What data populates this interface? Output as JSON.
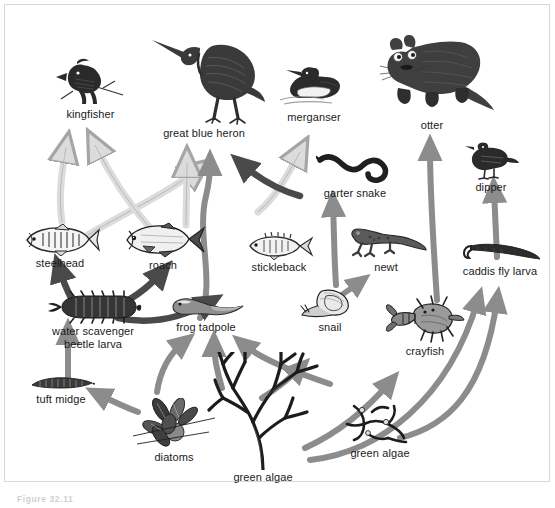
{
  "figure": {
    "caption": "Figure 32.11",
    "width": 555,
    "height": 508,
    "background": "#ffffff",
    "border_color": "#d8d8d8"
  },
  "palette": {
    "ink": "#1a1a1a",
    "arrow_light": "#d9d9d9",
    "arrow_light_stroke": "#9a9a9a",
    "arrow_mid": "#8c8c8c",
    "arrow_dark": "#4a4a4a",
    "label_text": "#1a1a1a"
  },
  "diagram": {
    "type": "food-web",
    "nodes": [
      {
        "id": "kingfisher",
        "label": "kingfisher",
        "x": 48,
        "y": 57,
        "w": 85,
        "h": 58,
        "trophic": "top predator"
      },
      {
        "id": "great-blue-heron",
        "label": "great blue heron",
        "x": 140,
        "y": 28,
        "w": 128,
        "h": 105,
        "trophic": "top predator"
      },
      {
        "id": "merganser",
        "label": "merganser",
        "x": 272,
        "y": 62,
        "w": 82,
        "h": 55,
        "trophic": "top predator"
      },
      {
        "id": "otter",
        "label": "otter",
        "x": 368,
        "y": 32,
        "w": 130,
        "h": 90,
        "trophic": "top predator"
      },
      {
        "id": "garter-snake",
        "label": "garter snake",
        "x": 316,
        "y": 148,
        "w": 78,
        "h": 42,
        "trophic": "predator"
      },
      {
        "id": "dipper",
        "label": "dipper",
        "x": 462,
        "y": 143,
        "w": 58,
        "h": 42,
        "trophic": "predator"
      },
      {
        "id": "steelhead",
        "label": "steelhead",
        "x": 20,
        "y": 224,
        "w": 80,
        "h": 43,
        "trophic": "fish"
      },
      {
        "id": "roach",
        "label": "roach",
        "x": 122,
        "y": 224,
        "w": 82,
        "h": 43,
        "trophic": "fish"
      },
      {
        "id": "stickleback",
        "label": "stickleback",
        "x": 243,
        "y": 232,
        "w": 72,
        "h": 38,
        "trophic": "fish"
      },
      {
        "id": "newt",
        "label": "newt",
        "x": 345,
        "y": 228,
        "w": 82,
        "h": 45,
        "trophic": "amphibian"
      },
      {
        "id": "caddis-fly-larva",
        "label": "caddis fly larva",
        "x": 456,
        "y": 243,
        "w": 84,
        "h": 36,
        "trophic": "invertebrate"
      },
      {
        "id": "water-beetle",
        "label": "water scavenger\nbeetle larva",
        "x": 40,
        "y": 292,
        "w": 108,
        "h": 62,
        "trophic": "invertebrate"
      },
      {
        "id": "frog-tadpole",
        "label": "frog tadpole",
        "x": 165,
        "y": 295,
        "w": 80,
        "h": 45,
        "trophic": "amphibian"
      },
      {
        "id": "snail",
        "label": "snail",
        "x": 300,
        "y": 287,
        "w": 62,
        "h": 48,
        "trophic": "invertebrate"
      },
      {
        "id": "crayfish",
        "label": "crayfish",
        "x": 386,
        "y": 296,
        "w": 78,
        "h": 62,
        "trophic": "invertebrate"
      },
      {
        "id": "tuft-midge",
        "label": "tuft midge",
        "x": 25,
        "y": 374,
        "w": 72,
        "h": 38,
        "trophic": "invertebrate"
      },
      {
        "id": "diatoms",
        "label": "diatoms",
        "x": 132,
        "y": 398,
        "w": 85,
        "h": 62,
        "trophic": "producer"
      },
      {
        "id": "green-algae-1",
        "label": "green algae",
        "x": 210,
        "y": 358,
        "w": 106,
        "h": 125,
        "trophic": "producer"
      },
      {
        "id": "green-algae-2",
        "label": "green algae",
        "x": 345,
        "y": 400,
        "w": 70,
        "h": 58,
        "trophic": "producer"
      }
    ],
    "links": [
      {
        "from": "steelhead",
        "to": "great-blue-heron",
        "tone": "light"
      },
      {
        "from": "roach",
        "to": "kingfisher",
        "tone": "light"
      },
      {
        "from": "steelhead",
        "to": "kingfisher",
        "tone": "light"
      },
      {
        "from": "roach",
        "to": "great-blue-heron",
        "tone": "light"
      },
      {
        "from": "frog-tadpole",
        "to": "great-blue-heron",
        "tone": "mid"
      },
      {
        "from": "garter-snake",
        "to": "great-blue-heron",
        "tone": "dark"
      },
      {
        "from": "stickleback",
        "to": "merganser",
        "tone": "light"
      },
      {
        "from": "newt",
        "to": "garter-snake",
        "tone": "mid"
      },
      {
        "from": "crayfish",
        "to": "otter",
        "tone": "mid"
      },
      {
        "from": "caddis-fly-larva",
        "to": "dipper",
        "tone": "mid"
      },
      {
        "from": "water-beetle",
        "to": "steelhead",
        "tone": "dark"
      },
      {
        "from": "water-beetle",
        "to": "roach",
        "tone": "dark"
      },
      {
        "from": "water-beetle",
        "to": "frog-tadpole",
        "tone": "dark"
      },
      {
        "from": "tuft-midge",
        "to": "water-beetle",
        "tone": "mid"
      },
      {
        "from": "diatoms",
        "to": "tuft-midge",
        "tone": "mid"
      },
      {
        "from": "diatoms",
        "to": "frog-tadpole",
        "tone": "mid"
      },
      {
        "from": "green-algae-1",
        "to": "frog-tadpole",
        "tone": "mid"
      },
      {
        "from": "green-algae-1",
        "to": "snail",
        "tone": "mid"
      },
      {
        "from": "green-algae-1",
        "to": "crayfish",
        "tone": "mid"
      },
      {
        "from": "green-algae-1",
        "to": "caddis-fly-larva",
        "tone": "mid"
      },
      {
        "from": "green-algae-2",
        "to": "caddis-fly-larva",
        "tone": "mid"
      },
      {
        "from": "snail",
        "to": "newt",
        "tone": "mid"
      }
    ]
  }
}
